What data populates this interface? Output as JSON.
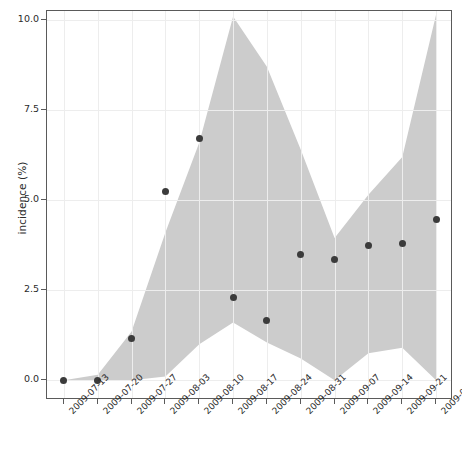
{
  "chart_data": {
    "type": "line",
    "title": "",
    "xlabel": "",
    "ylabel": "incidence (%)",
    "ylim": [
      -0.55,
      10.25
    ],
    "yticks": [
      0.0,
      2.5,
      5.0,
      7.5,
      10.0
    ],
    "ytick_labels": [
      "0.0",
      "2.5",
      "5.0",
      "7.5",
      "10.0"
    ],
    "grid": true,
    "legend": "none",
    "categories": [
      "2009-07-13",
      "2009-07-20",
      "2009-07-27",
      "2009-08-03",
      "2009-08-10",
      "2009-08-17",
      "2009-08-24",
      "2009-08-31",
      "2009-09-07",
      "2009-09-14",
      "2009-09-21",
      "2009-09-28"
    ],
    "series": [
      {
        "name": "observed incidence",
        "style": "points",
        "marker": "circle",
        "color": "#3b3b3b",
        "values": [
          0.0,
          0.0,
          1.15,
          5.25,
          6.7,
          2.3,
          1.65,
          3.5,
          3.35,
          3.75,
          3.8,
          4.45
        ]
      },
      {
        "name": "credible interval",
        "style": "band",
        "color": "#cccccc",
        "lower": [
          0.0,
          0.0,
          0.0,
          0.1,
          1.0,
          1.6,
          1.05,
          0.6,
          0.0,
          0.75,
          0.9,
          0.0
        ],
        "upper": [
          0.0,
          0.15,
          1.35,
          4.1,
          6.6,
          10.1,
          8.7,
          6.4,
          3.95,
          5.15,
          6.2,
          10.15
        ]
      }
    ]
  }
}
